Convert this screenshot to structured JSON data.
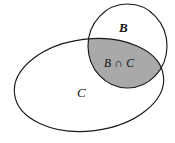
{
  "figure": {
    "type": "venn-diagram",
    "background_color": "#ffffff",
    "outline_color": "#1a1a1a",
    "shade_color": "#a9a9a9",
    "sets": [
      {
        "name": "set-b",
        "label": "B",
        "shape": "circle",
        "shaded": false
      },
      {
        "name": "set-c",
        "label": "C",
        "shape": "ellipse",
        "shaded": false
      }
    ],
    "regions": [
      {
        "name": "intersection-b-c",
        "label": "B ∩ C",
        "shaded": true,
        "shade_color": "#a9a9a9"
      }
    ],
    "labels": {
      "b": "B",
      "c": "C",
      "intersection": "B ∩ C"
    }
  }
}
